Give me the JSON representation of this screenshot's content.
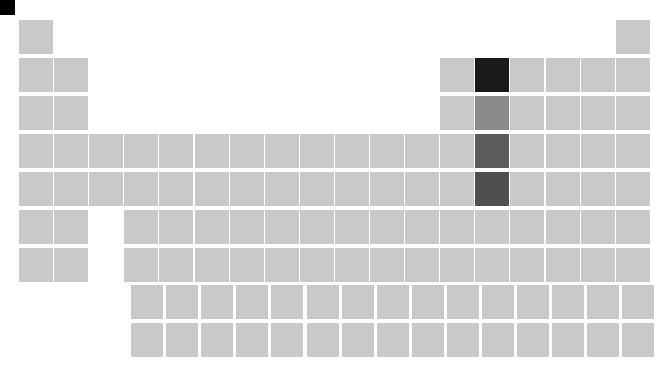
{
  "figure": {
    "title": "",
    "type": "periodic-table-heatmap",
    "background_color": "#ffffff",
    "default_cell_color": "#c9c9c9",
    "corner_marker_color": "#000000"
  },
  "chart_data": {
    "type": "heatmap",
    "title": "",
    "subtitle": "",
    "xlabel": "",
    "ylabel": "",
    "legend": "none",
    "grid": false,
    "layout": "periodic-table",
    "columns": 18,
    "periods": 7,
    "fblock_rows": 2,
    "fblock_length": 15,
    "fblock_start_column": 4,
    "colormap": "greys",
    "value_range": [
      0,
      1
    ],
    "cells": [
      {
        "symbol": "H",
        "number": 1,
        "group": 1,
        "period": 1,
        "color": "#c9c9c9",
        "value": 0.08
      },
      {
        "symbol": "He",
        "number": 2,
        "group": 18,
        "period": 1,
        "color": "#c9c9c9",
        "value": 0.08
      },
      {
        "symbol": "Li",
        "number": 3,
        "group": 1,
        "period": 2,
        "color": "#c9c9c9",
        "value": 0.08
      },
      {
        "symbol": "Be",
        "number": 4,
        "group": 2,
        "period": 2,
        "color": "#c9c9c9",
        "value": 0.08
      },
      {
        "symbol": "B",
        "number": 5,
        "group": 13,
        "period": 2,
        "color": "#c9c9c9",
        "value": 0.08
      },
      {
        "symbol": "C",
        "number": 6,
        "group": 14,
        "period": 2,
        "color": "#1a1a1a",
        "value": 0.95
      },
      {
        "symbol": "N",
        "number": 7,
        "group": 15,
        "period": 2,
        "color": "#c9c9c9",
        "value": 0.08
      },
      {
        "symbol": "O",
        "number": 8,
        "group": 16,
        "period": 2,
        "color": "#c9c9c9",
        "value": 0.08
      },
      {
        "symbol": "F",
        "number": 9,
        "group": 17,
        "period": 2,
        "color": "#c9c9c9",
        "value": 0.08
      },
      {
        "symbol": "Ne",
        "number": 10,
        "group": 18,
        "period": 2,
        "color": "#c9c9c9",
        "value": 0.08
      },
      {
        "symbol": "Na",
        "number": 11,
        "group": 1,
        "period": 3,
        "color": "#c9c9c9",
        "value": 0.08
      },
      {
        "symbol": "Mg",
        "number": 12,
        "group": 2,
        "period": 3,
        "color": "#c9c9c9",
        "value": 0.08
      },
      {
        "symbol": "Al",
        "number": 13,
        "group": 13,
        "period": 3,
        "color": "#c9c9c9",
        "value": 0.08
      },
      {
        "symbol": "Si",
        "number": 14,
        "group": 14,
        "period": 3,
        "color": "#8a8a8a",
        "value": 0.5
      },
      {
        "symbol": "P",
        "number": 15,
        "group": 15,
        "period": 3,
        "color": "#c9c9c9",
        "value": 0.08
      },
      {
        "symbol": "S",
        "number": 16,
        "group": 16,
        "period": 3,
        "color": "#c9c9c9",
        "value": 0.08
      },
      {
        "symbol": "Cl",
        "number": 17,
        "group": 17,
        "period": 3,
        "color": "#c9c9c9",
        "value": 0.08
      },
      {
        "symbol": "Ar",
        "number": 18,
        "group": 18,
        "period": 3,
        "color": "#c9c9c9",
        "value": 0.08
      },
      {
        "symbol": "K",
        "number": 19,
        "group": 1,
        "period": 4,
        "color": "#c9c9c9",
        "value": 0.08
      },
      {
        "symbol": "Ca",
        "number": 20,
        "group": 2,
        "period": 4,
        "color": "#c9c9c9",
        "value": 0.08
      },
      {
        "symbol": "Sc",
        "number": 21,
        "group": 3,
        "period": 4,
        "color": "#c9c9c9",
        "value": 0.08
      },
      {
        "symbol": "Ti",
        "number": 22,
        "group": 4,
        "period": 4,
        "color": "#c9c9c9",
        "value": 0.08
      },
      {
        "symbol": "V",
        "number": 23,
        "group": 5,
        "period": 4,
        "color": "#c9c9c9",
        "value": 0.08
      },
      {
        "symbol": "Cr",
        "number": 24,
        "group": 6,
        "period": 4,
        "color": "#c9c9c9",
        "value": 0.08
      },
      {
        "symbol": "Mn",
        "number": 25,
        "group": 7,
        "period": 4,
        "color": "#c9c9c9",
        "value": 0.08
      },
      {
        "symbol": "Fe",
        "number": 26,
        "group": 8,
        "period": 4,
        "color": "#c9c9c9",
        "value": 0.08
      },
      {
        "symbol": "Co",
        "number": 27,
        "group": 9,
        "period": 4,
        "color": "#c9c9c9",
        "value": 0.08
      },
      {
        "symbol": "Ni",
        "number": 28,
        "group": 10,
        "period": 4,
        "color": "#c9c9c9",
        "value": 0.08
      },
      {
        "symbol": "Cu",
        "number": 29,
        "group": 11,
        "period": 4,
        "color": "#c9c9c9",
        "value": 0.08
      },
      {
        "symbol": "Zn",
        "number": 30,
        "group": 12,
        "period": 4,
        "color": "#c9c9c9",
        "value": 0.08
      },
      {
        "symbol": "Ga",
        "number": 31,
        "group": 13,
        "period": 4,
        "color": "#c9c9c9",
        "value": 0.08
      },
      {
        "symbol": "Ge",
        "number": 32,
        "group": 14,
        "period": 4,
        "color": "#5c5c5c",
        "value": 0.72
      },
      {
        "symbol": "As",
        "number": 33,
        "group": 15,
        "period": 4,
        "color": "#c9c9c9",
        "value": 0.08
      },
      {
        "symbol": "Se",
        "number": 34,
        "group": 16,
        "period": 4,
        "color": "#c9c9c9",
        "value": 0.08
      },
      {
        "symbol": "Br",
        "number": 35,
        "group": 17,
        "period": 4,
        "color": "#c9c9c9",
        "value": 0.08
      },
      {
        "symbol": "Kr",
        "number": 36,
        "group": 18,
        "period": 4,
        "color": "#c9c9c9",
        "value": 0.08
      },
      {
        "symbol": "Rb",
        "number": 37,
        "group": 1,
        "period": 5,
        "color": "#c9c9c9",
        "value": 0.08
      },
      {
        "symbol": "Sr",
        "number": 38,
        "group": 2,
        "period": 5,
        "color": "#c9c9c9",
        "value": 0.08
      },
      {
        "symbol": "Y",
        "number": 39,
        "group": 3,
        "period": 5,
        "color": "#c9c9c9",
        "value": 0.08
      },
      {
        "symbol": "Zr",
        "number": 40,
        "group": 4,
        "period": 5,
        "color": "#c9c9c9",
        "value": 0.08
      },
      {
        "symbol": "Nb",
        "number": 41,
        "group": 5,
        "period": 5,
        "color": "#c9c9c9",
        "value": 0.08
      },
      {
        "symbol": "Mo",
        "number": 42,
        "group": 6,
        "period": 5,
        "color": "#c9c9c9",
        "value": 0.08
      },
      {
        "symbol": "Tc",
        "number": 43,
        "group": 7,
        "period": 5,
        "color": "#c9c9c9",
        "value": 0.08
      },
      {
        "symbol": "Ru",
        "number": 44,
        "group": 8,
        "period": 5,
        "color": "#c9c9c9",
        "value": 0.08
      },
      {
        "symbol": "Rh",
        "number": 45,
        "group": 9,
        "period": 5,
        "color": "#c9c9c9",
        "value": 0.08
      },
      {
        "symbol": "Pd",
        "number": 46,
        "group": 10,
        "period": 5,
        "color": "#c9c9c9",
        "value": 0.08
      },
      {
        "symbol": "Ag",
        "number": 47,
        "group": 11,
        "period": 5,
        "color": "#c9c9c9",
        "value": 0.08
      },
      {
        "symbol": "Cd",
        "number": 48,
        "group": 12,
        "period": 5,
        "color": "#c9c9c9",
        "value": 0.08
      },
      {
        "symbol": "In",
        "number": 49,
        "group": 13,
        "period": 5,
        "color": "#c9c9c9",
        "value": 0.08
      },
      {
        "symbol": "Sn",
        "number": 50,
        "group": 14,
        "period": 5,
        "color": "#4f4f4f",
        "value": 0.78
      },
      {
        "symbol": "Sb",
        "number": 51,
        "group": 15,
        "period": 5,
        "color": "#c9c9c9",
        "value": 0.08
      },
      {
        "symbol": "Te",
        "number": 52,
        "group": 16,
        "period": 5,
        "color": "#c9c9c9",
        "value": 0.08
      },
      {
        "symbol": "I",
        "number": 53,
        "group": 17,
        "period": 5,
        "color": "#c9c9c9",
        "value": 0.08
      },
      {
        "symbol": "Xe",
        "number": 54,
        "group": 18,
        "period": 5,
        "color": "#c9c9c9",
        "value": 0.08
      },
      {
        "symbol": "Cs",
        "number": 55,
        "group": 1,
        "period": 6,
        "color": "#c9c9c9",
        "value": 0.08
      },
      {
        "symbol": "Ba",
        "number": 56,
        "group": 2,
        "period": 6,
        "color": "#c9c9c9",
        "value": 0.08
      },
      {
        "symbol": "Hf",
        "number": 72,
        "group": 4,
        "period": 6,
        "color": "#c9c9c9",
        "value": 0.08
      },
      {
        "symbol": "Ta",
        "number": 73,
        "group": 5,
        "period": 6,
        "color": "#c9c9c9",
        "value": 0.08
      },
      {
        "symbol": "W",
        "number": 74,
        "group": 6,
        "period": 6,
        "color": "#c9c9c9",
        "value": 0.08
      },
      {
        "symbol": "Re",
        "number": 75,
        "group": 7,
        "period": 6,
        "color": "#c9c9c9",
        "value": 0.08
      },
      {
        "symbol": "Os",
        "number": 76,
        "group": 8,
        "period": 6,
        "color": "#c9c9c9",
        "value": 0.08
      },
      {
        "symbol": "Ir",
        "number": 77,
        "group": 9,
        "period": 6,
        "color": "#c9c9c9",
        "value": 0.08
      },
      {
        "symbol": "Pt",
        "number": 78,
        "group": 10,
        "period": 6,
        "color": "#c9c9c9",
        "value": 0.08
      },
      {
        "symbol": "Au",
        "number": 79,
        "group": 11,
        "period": 6,
        "color": "#c9c9c9",
        "value": 0.08
      },
      {
        "symbol": "Hg",
        "number": 80,
        "group": 12,
        "period": 6,
        "color": "#c9c9c9",
        "value": 0.08
      },
      {
        "symbol": "Tl",
        "number": 81,
        "group": 13,
        "period": 6,
        "color": "#c9c9c9",
        "value": 0.08
      },
      {
        "symbol": "Pb",
        "number": 82,
        "group": 14,
        "period": 6,
        "color": "#c9c9c9",
        "value": 0.08
      },
      {
        "symbol": "Bi",
        "number": 83,
        "group": 15,
        "period": 6,
        "color": "#c9c9c9",
        "value": 0.08
      },
      {
        "symbol": "Po",
        "number": 84,
        "group": 16,
        "period": 6,
        "color": "#c9c9c9",
        "value": 0.08
      },
      {
        "symbol": "At",
        "number": 85,
        "group": 17,
        "period": 6,
        "color": "#c9c9c9",
        "value": 0.08
      },
      {
        "symbol": "Rn",
        "number": 86,
        "group": 18,
        "period": 6,
        "color": "#c9c9c9",
        "value": 0.08
      },
      {
        "symbol": "Fr",
        "number": 87,
        "group": 1,
        "period": 7,
        "color": "#c9c9c9",
        "value": 0.08
      },
      {
        "symbol": "Ra",
        "number": 88,
        "group": 2,
        "period": 7,
        "color": "#c9c9c9",
        "value": 0.08
      },
      {
        "symbol": "Rf",
        "number": 104,
        "group": 4,
        "period": 7,
        "color": "#c9c9c9",
        "value": 0.08
      },
      {
        "symbol": "Db",
        "number": 105,
        "group": 5,
        "period": 7,
        "color": "#c9c9c9",
        "value": 0.08
      },
      {
        "symbol": "Sg",
        "number": 106,
        "group": 6,
        "period": 7,
        "color": "#c9c9c9",
        "value": 0.08
      },
      {
        "symbol": "Bh",
        "number": 107,
        "group": 7,
        "period": 7,
        "color": "#c9c9c9",
        "value": 0.08
      },
      {
        "symbol": "Hs",
        "number": 108,
        "group": 8,
        "period": 7,
        "color": "#c9c9c9",
        "value": 0.08
      },
      {
        "symbol": "Mt",
        "number": 109,
        "group": 9,
        "period": 7,
        "color": "#c9c9c9",
        "value": 0.08
      },
      {
        "symbol": "Ds",
        "number": 110,
        "group": 10,
        "period": 7,
        "color": "#c9c9c9",
        "value": 0.08
      },
      {
        "symbol": "Rg",
        "number": 111,
        "group": 11,
        "period": 7,
        "color": "#c9c9c9",
        "value": 0.08
      },
      {
        "symbol": "Cn",
        "number": 112,
        "group": 12,
        "period": 7,
        "color": "#c9c9c9",
        "value": 0.08
      },
      {
        "symbol": "Nh",
        "number": 113,
        "group": 13,
        "period": 7,
        "color": "#c9c9c9",
        "value": 0.08
      },
      {
        "symbol": "Fl",
        "number": 114,
        "group": 14,
        "period": 7,
        "color": "#c9c9c9",
        "value": 0.08
      },
      {
        "symbol": "Mc",
        "number": 115,
        "group": 15,
        "period": 7,
        "color": "#c9c9c9",
        "value": 0.08
      },
      {
        "symbol": "Lv",
        "number": 116,
        "group": 16,
        "period": 7,
        "color": "#c9c9c9",
        "value": 0.08
      },
      {
        "symbol": "Ts",
        "number": 117,
        "group": 17,
        "period": 7,
        "color": "#c9c9c9",
        "value": 0.08
      },
      {
        "symbol": "Og",
        "number": 118,
        "group": 18,
        "period": 7,
        "color": "#c9c9c9",
        "value": 0.08
      }
    ],
    "fblock_cells": [
      {
        "symbol": "La",
        "number": 57,
        "row": 1,
        "index": 1,
        "color": "#c9c9c9",
        "value": 0.08
      },
      {
        "symbol": "Ce",
        "number": 58,
        "row": 1,
        "index": 2,
        "color": "#c9c9c9",
        "value": 0.08
      },
      {
        "symbol": "Pr",
        "number": 59,
        "row": 1,
        "index": 3,
        "color": "#c9c9c9",
        "value": 0.08
      },
      {
        "symbol": "Nd",
        "number": 60,
        "row": 1,
        "index": 4,
        "color": "#c9c9c9",
        "value": 0.08
      },
      {
        "symbol": "Pm",
        "number": 61,
        "row": 1,
        "index": 5,
        "color": "#c9c9c9",
        "value": 0.08
      },
      {
        "symbol": "Sm",
        "number": 62,
        "row": 1,
        "index": 6,
        "color": "#c9c9c9",
        "value": 0.08
      },
      {
        "symbol": "Eu",
        "number": 63,
        "row": 1,
        "index": 7,
        "color": "#c9c9c9",
        "value": 0.08
      },
      {
        "symbol": "Gd",
        "number": 64,
        "row": 1,
        "index": 8,
        "color": "#c9c9c9",
        "value": 0.08
      },
      {
        "symbol": "Tb",
        "number": 65,
        "row": 1,
        "index": 9,
        "color": "#c9c9c9",
        "value": 0.08
      },
      {
        "symbol": "Dy",
        "number": 66,
        "row": 1,
        "index": 10,
        "color": "#c9c9c9",
        "value": 0.08
      },
      {
        "symbol": "Ho",
        "number": 67,
        "row": 1,
        "index": 11,
        "color": "#c9c9c9",
        "value": 0.08
      },
      {
        "symbol": "Er",
        "number": 68,
        "row": 1,
        "index": 12,
        "color": "#c9c9c9",
        "value": 0.08
      },
      {
        "symbol": "Tm",
        "number": 69,
        "row": 1,
        "index": 13,
        "color": "#c9c9c9",
        "value": 0.08
      },
      {
        "symbol": "Yb",
        "number": 70,
        "row": 1,
        "index": 14,
        "color": "#c9c9c9",
        "value": 0.08
      },
      {
        "symbol": "Lu",
        "number": 71,
        "row": 1,
        "index": 15,
        "color": "#c9c9c9",
        "value": 0.08
      },
      {
        "symbol": "Ac",
        "number": 89,
        "row": 2,
        "index": 1,
        "color": "#c9c9c9",
        "value": 0.08
      },
      {
        "symbol": "Th",
        "number": 90,
        "row": 2,
        "index": 2,
        "color": "#c9c9c9",
        "value": 0.08
      },
      {
        "symbol": "Pa",
        "number": 91,
        "row": 2,
        "index": 3,
        "color": "#c9c9c9",
        "value": 0.08
      },
      {
        "symbol": "U",
        "number": 92,
        "row": 2,
        "index": 4,
        "color": "#c9c9c9",
        "value": 0.08
      },
      {
        "symbol": "Np",
        "number": 93,
        "row": 2,
        "index": 5,
        "color": "#c9c9c9",
        "value": 0.08
      },
      {
        "symbol": "Pu",
        "number": 94,
        "row": 2,
        "index": 6,
        "color": "#c9c9c9",
        "value": 0.08
      },
      {
        "symbol": "Am",
        "number": 95,
        "row": 2,
        "index": 7,
        "color": "#c9c9c9",
        "value": 0.08
      },
      {
        "symbol": "Cm",
        "number": 96,
        "row": 2,
        "index": 8,
        "color": "#c9c9c9",
        "value": 0.08
      },
      {
        "symbol": "Bk",
        "number": 97,
        "row": 2,
        "index": 9,
        "color": "#c9c9c9",
        "value": 0.08
      },
      {
        "symbol": "Cf",
        "number": 98,
        "row": 2,
        "index": 10,
        "color": "#c9c9c9",
        "value": 0.08
      },
      {
        "symbol": "Es",
        "number": 99,
        "row": 2,
        "index": 11,
        "color": "#c9c9c9",
        "value": 0.08
      },
      {
        "symbol": "Fm",
        "number": 100,
        "row": 2,
        "index": 12,
        "color": "#c9c9c9",
        "value": 0.08
      },
      {
        "symbol": "Md",
        "number": 101,
        "row": 2,
        "index": 13,
        "color": "#c9c9c9",
        "value": 0.08
      },
      {
        "symbol": "No",
        "number": 102,
        "row": 2,
        "index": 14,
        "color": "#c9c9c9",
        "value": 0.08
      },
      {
        "symbol": "Lr",
        "number": 103,
        "row": 2,
        "index": 15,
        "color": "#c9c9c9",
        "value": 0.08
      }
    ]
  },
  "geometry": {
    "origin_x": 19,
    "origin_y": 20,
    "col_pitch": 35.1,
    "row_pitch": 38,
    "cell_w": 34,
    "cell_h": 34,
    "fblock_origin_x": 131,
    "fblock_origin_y": 285,
    "fblock_col_pitch": 35.1,
    "fblock_row_pitch": 38,
    "fblock_cell_w": 32
  }
}
